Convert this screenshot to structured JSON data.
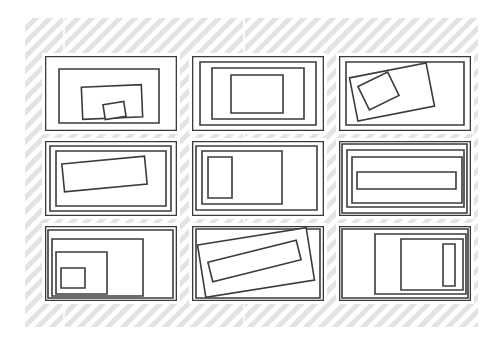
{
  "figure": {
    "background_color": "#ffffff",
    "panel_color": "#f4f4f4",
    "panel_hatch_color": "#e2e2e2",
    "card_color": "#ffffff",
    "stroke_color": "#3b3b3b",
    "stroke_width": 1.6,
    "rows": 3,
    "columns": 3,
    "cell_count": 9
  },
  "panel": {
    "x": 25,
    "y": 18,
    "width": 453,
    "height": 309
  },
  "seams": [
    {
      "x": 63
    },
    {
      "x": 243
    }
  ],
  "cells": [
    {
      "id": "cell-1",
      "name": "nested-rects-offset-bottom",
      "x": 45,
      "y": 56,
      "width": 132,
      "height": 75,
      "shapes": [
        {
          "name": "frame",
          "x": 0.5,
          "y": 0.5,
          "w": 131,
          "h": 74,
          "rotate": 0
        },
        {
          "name": "rect-2",
          "x": 14,
          "y": 13,
          "w": 100,
          "h": 54,
          "rotate": 0
        },
        {
          "name": "rect-3",
          "x": 37,
          "y": 30,
          "w": 60,
          "h": 32,
          "rotate": -2.5
        },
        {
          "name": "rect-4-small",
          "x": 59,
          "y": 47,
          "w": 21,
          "h": 15,
          "rotate": -9
        }
      ]
    },
    {
      "id": "cell-2",
      "name": "concentric-rects-centered",
      "x": 192,
      "y": 56,
      "width": 132,
      "height": 75,
      "shapes": [
        {
          "name": "frame",
          "x": 0.5,
          "y": 0.5,
          "w": 131,
          "h": 74,
          "rotate": 0
        },
        {
          "name": "rect-2",
          "x": 8,
          "y": 6,
          "w": 116,
          "h": 63,
          "rotate": 0
        },
        {
          "name": "rect-3",
          "x": 20,
          "y": 12,
          "w": 92,
          "h": 51,
          "rotate": 0
        },
        {
          "name": "rect-4-square",
          "x": 39,
          "y": 19,
          "w": 52,
          "h": 38,
          "rotate": 0
        }
      ]
    },
    {
      "id": "cell-3",
      "name": "rotated-rect-with-tilted-square",
      "x": 339,
      "y": 56,
      "width": 132,
      "height": 75,
      "shapes": [
        {
          "name": "frame",
          "x": 0.5,
          "y": 0.5,
          "w": 131,
          "h": 74,
          "rotate": 0
        },
        {
          "name": "rect-2",
          "x": 7,
          "y": 6,
          "w": 118,
          "h": 63,
          "rotate": 0
        },
        {
          "name": "rect-3-tilted",
          "x": 14,
          "y": 14,
          "w": 78,
          "h": 44,
          "rotate": -11
        },
        {
          "name": "rect-4-tilted",
          "x": 23,
          "y": 22,
          "w": 33,
          "h": 26,
          "rotate": -26
        }
      ]
    },
    {
      "id": "cell-4",
      "name": "nested-rects-with-tilted-bar",
      "x": 45,
      "y": 141,
      "width": 132,
      "height": 75,
      "shapes": [
        {
          "name": "frame",
          "x": 0.5,
          "y": 0.5,
          "w": 131,
          "h": 74,
          "rotate": 0
        },
        {
          "name": "rect-2",
          "x": 5,
          "y": 5,
          "w": 121,
          "h": 65,
          "rotate": 0
        },
        {
          "name": "rect-3",
          "x": 11,
          "y": 10,
          "w": 110,
          "h": 55,
          "rotate": 0
        },
        {
          "name": "rect-4-tilted",
          "x": 18,
          "y": 19,
          "w": 83,
          "h": 28,
          "rotate": -5.5
        }
      ]
    },
    {
      "id": "cell-5",
      "name": "left-anchored-portrait-rect",
      "x": 192,
      "y": 141,
      "width": 132,
      "height": 75,
      "shapes": [
        {
          "name": "frame",
          "x": 0.5,
          "y": 0.5,
          "w": 131,
          "h": 74,
          "rotate": 0
        },
        {
          "name": "rect-2",
          "x": 4,
          "y": 5,
          "w": 121,
          "h": 64,
          "rotate": 0
        },
        {
          "name": "rect-3-left",
          "x": 10,
          "y": 10,
          "w": 80,
          "h": 53,
          "rotate": 0
        },
        {
          "name": "rect-4-portrait",
          "x": 16,
          "y": 16,
          "w": 24,
          "h": 41,
          "rotate": 0
        }
      ]
    },
    {
      "id": "cell-6",
      "name": "stacked-rects-with-wide-bar",
      "x": 339,
      "y": 141,
      "width": 132,
      "height": 75,
      "shapes": [
        {
          "name": "frame",
          "x": 0.5,
          "y": 0.5,
          "w": 131,
          "h": 74,
          "rotate": 0
        },
        {
          "name": "rect-2",
          "x": 3,
          "y": 3,
          "w": 125,
          "h": 69,
          "rotate": 0
        },
        {
          "name": "rect-3",
          "x": 8,
          "y": 9,
          "w": 117,
          "h": 57,
          "rotate": 0
        },
        {
          "name": "rect-4",
          "x": 13,
          "y": 16,
          "w": 110,
          "h": 46,
          "rotate": 0
        },
        {
          "name": "rect-5-bar",
          "x": 18,
          "y": 31,
          "w": 99,
          "h": 17,
          "rotate": 0
        }
      ]
    },
    {
      "id": "cell-7",
      "name": "corner-nested-rects-bottom-left",
      "x": 45,
      "y": 226,
      "width": 132,
      "height": 75,
      "shapes": [
        {
          "name": "frame",
          "x": 0.5,
          "y": 0.5,
          "w": 131,
          "h": 74,
          "rotate": 0
        },
        {
          "name": "rect-2",
          "x": 3,
          "y": 4,
          "w": 125,
          "h": 68,
          "rotate": 0
        },
        {
          "name": "rect-3",
          "x": 7,
          "y": 13,
          "w": 91,
          "h": 57,
          "rotate": 0
        },
        {
          "name": "rect-4",
          "x": 11,
          "y": 26,
          "w": 51,
          "h": 42,
          "rotate": 0
        },
        {
          "name": "rect-5-small",
          "x": 16,
          "y": 42,
          "w": 24,
          "h": 20,
          "rotate": 0
        }
      ]
    },
    {
      "id": "cell-8",
      "name": "tilted-rect-with-thin-diagonal-bar",
      "x": 192,
      "y": 226,
      "width": 132,
      "height": 75,
      "shapes": [
        {
          "name": "frame",
          "x": 0.5,
          "y": 0.5,
          "w": 131,
          "h": 74,
          "rotate": 0
        },
        {
          "name": "rect-2",
          "x": 4,
          "y": 3,
          "w": 124,
          "h": 69,
          "rotate": 0
        },
        {
          "name": "rect-3-tilted",
          "x": 9,
          "y": 10,
          "w": 110,
          "h": 53,
          "rotate": -9
        },
        {
          "name": "rect-4-tilted-bar",
          "x": 17,
          "y": 25,
          "w": 91,
          "h": 20,
          "rotate": -14
        }
      ]
    },
    {
      "id": "cell-9",
      "name": "right-anchored-rects-with-thin-bar",
      "x": 339,
      "y": 226,
      "width": 132,
      "height": 75,
      "shapes": [
        {
          "name": "frame",
          "x": 0.5,
          "y": 0.5,
          "w": 131,
          "h": 74,
          "rotate": 0
        },
        {
          "name": "rect-2",
          "x": 3,
          "y": 3,
          "w": 126,
          "h": 69,
          "rotate": 0
        },
        {
          "name": "rect-3-right",
          "x": 36,
          "y": 8,
          "w": 91,
          "h": 60,
          "rotate": 0
        },
        {
          "name": "rect-4-square",
          "x": 62,
          "y": 13,
          "w": 62,
          "h": 51,
          "rotate": 0
        },
        {
          "name": "rect-5-thin-bar",
          "x": 104,
          "y": 18,
          "w": 12,
          "h": 42,
          "rotate": 0
        }
      ]
    }
  ]
}
